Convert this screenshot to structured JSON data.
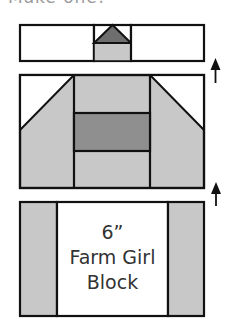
{
  "caption": "Make one!",
  "colors": {
    "outline": "#111111",
    "light_fabric": "#c8c8c8",
    "medium_fabric": "#8f8f8f",
    "dark_fabric": "#6e6e6e",
    "background_fabric": "#ffffff",
    "text": "#333333"
  },
  "rows": [
    {
      "name": "top-row",
      "pieces": [
        "white-rect-left",
        "flying-geese-square",
        "white-rect-right"
      ]
    },
    {
      "name": "middle-row",
      "pieces": [
        "left-snowball-corner-unit",
        "center-stack",
        "right-snowball-corner-unit"
      ]
    },
    {
      "name": "bottom-row",
      "pieces": [
        "left-strip",
        "center-block",
        "right-strip"
      ]
    }
  ],
  "arrows": [
    {
      "name": "arrow-row-1-to-2",
      "direction": "up"
    },
    {
      "name": "arrow-row-2-to-3",
      "direction": "up"
    }
  ],
  "center_block": {
    "size_label": "6”",
    "name_line1": "Farm Girl",
    "name_line2": "Block"
  }
}
